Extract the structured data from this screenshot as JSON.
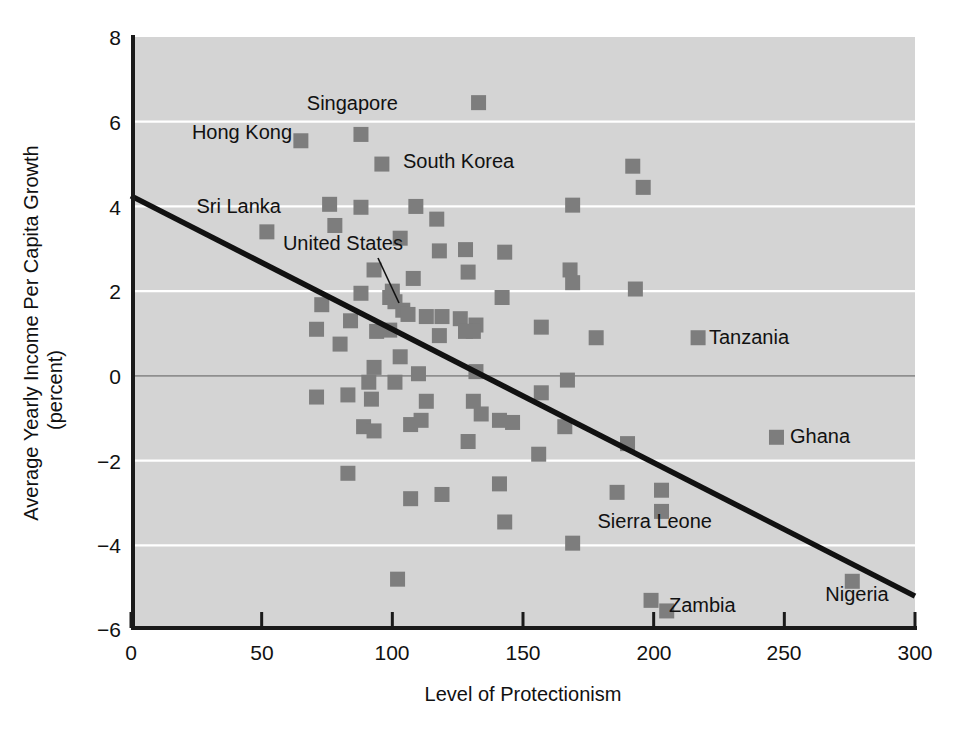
{
  "chart_data": {
    "type": "scatter",
    "title": "",
    "xlabel": "Level of Protectionism",
    "ylabel": "Average Yearly Income Per Capita Growth (percent)",
    "ylabel_line1": "Average Yearly Income Per Capita Growth",
    "ylabel_line2": "(percent)",
    "xlim": [
      0,
      300
    ],
    "ylim": [
      -6,
      8
    ],
    "xticks": [
      0,
      50,
      100,
      150,
      200,
      250,
      300
    ],
    "xtick_labels": [
      "0",
      "50",
      "100",
      "150",
      "200",
      "250",
      "300"
    ],
    "yticks": [
      8,
      6,
      4,
      2,
      0,
      -2,
      -4,
      -6
    ],
    "ytick_labels": [
      "8",
      "6",
      "4",
      "2",
      "0",
      "−2",
      "−4",
      "−6"
    ],
    "grid": true,
    "gridlines_y": [
      6,
      4,
      2,
      0,
      -2,
      -4
    ],
    "legend": "none",
    "plot_background_color": "#d4d4d4",
    "gridline_color": "#ffffff",
    "marker_color": "#7d7d7d",
    "trendline_color": "#111111",
    "marker_shape": "square",
    "trendline": {
      "label": "fitted regression line",
      "x_start": 0,
      "y_start": 4.25,
      "x_end": 300,
      "y_end": -5.2
    },
    "points": [
      {
        "x": 52,
        "y": 3.4,
        "label": "Sri Lanka"
      },
      {
        "x": 65,
        "y": 5.55,
        "label": "Hong Kong"
      },
      {
        "x": 88,
        "y": 5.7,
        "label": "Singapore"
      },
      {
        "x": 96,
        "y": 5.0,
        "label": "South Korea"
      },
      {
        "x": 99,
        "y": 1.85,
        "label": "United States"
      },
      {
        "x": 217,
        "y": 0.9,
        "label": "Tanzania"
      },
      {
        "x": 247,
        "y": -1.45,
        "label": "Ghana"
      },
      {
        "x": 203,
        "y": -2.7,
        "label": "Sierra Leone"
      },
      {
        "x": 203,
        "y": -3.2,
        "label": "Sierra Leone"
      },
      {
        "x": 205,
        "y": -5.55,
        "label": "Zambia"
      },
      {
        "x": 276,
        "y": -4.85,
        "label": "Nigeria"
      },
      {
        "x": 133,
        "y": 6.45,
        "label": ""
      },
      {
        "x": 192,
        "y": 4.95,
        "label": ""
      },
      {
        "x": 196,
        "y": 4.45,
        "label": ""
      },
      {
        "x": 76,
        "y": 4.05,
        "label": ""
      },
      {
        "x": 88,
        "y": 3.98,
        "label": ""
      },
      {
        "x": 109,
        "y": 4.0,
        "label": ""
      },
      {
        "x": 169,
        "y": 4.03,
        "label": ""
      },
      {
        "x": 78,
        "y": 3.55,
        "label": ""
      },
      {
        "x": 117,
        "y": 3.7,
        "label": ""
      },
      {
        "x": 103,
        "y": 3.25,
        "label": ""
      },
      {
        "x": 118,
        "y": 2.95,
        "label": ""
      },
      {
        "x": 128,
        "y": 2.98,
        "label": ""
      },
      {
        "x": 143,
        "y": 2.92,
        "label": ""
      },
      {
        "x": 93,
        "y": 2.5,
        "label": ""
      },
      {
        "x": 129,
        "y": 2.45,
        "label": ""
      },
      {
        "x": 168,
        "y": 2.5,
        "label": ""
      },
      {
        "x": 108,
        "y": 2.3,
        "label": ""
      },
      {
        "x": 169,
        "y": 2.2,
        "label": ""
      },
      {
        "x": 193,
        "y": 2.05,
        "label": ""
      },
      {
        "x": 88,
        "y": 1.95,
        "label": ""
      },
      {
        "x": 100,
        "y": 2.0,
        "label": ""
      },
      {
        "x": 101,
        "y": 1.75,
        "label": ""
      },
      {
        "x": 142,
        "y": 1.85,
        "label": ""
      },
      {
        "x": 73,
        "y": 1.68,
        "label": ""
      },
      {
        "x": 104,
        "y": 1.55,
        "label": ""
      },
      {
        "x": 106,
        "y": 1.45,
        "label": ""
      },
      {
        "x": 113,
        "y": 1.4,
        "label": ""
      },
      {
        "x": 119,
        "y": 1.4,
        "label": ""
      },
      {
        "x": 126,
        "y": 1.35,
        "label": ""
      },
      {
        "x": 132,
        "y": 1.2,
        "label": ""
      },
      {
        "x": 84,
        "y": 1.3,
        "label": ""
      },
      {
        "x": 71,
        "y": 1.1,
        "label": ""
      },
      {
        "x": 94,
        "y": 1.05,
        "label": ""
      },
      {
        "x": 99,
        "y": 1.08,
        "label": ""
      },
      {
        "x": 118,
        "y": 0.95,
        "label": ""
      },
      {
        "x": 128,
        "y": 1.05,
        "label": ""
      },
      {
        "x": 131,
        "y": 1.05,
        "label": ""
      },
      {
        "x": 157,
        "y": 1.15,
        "label": ""
      },
      {
        "x": 178,
        "y": 0.9,
        "label": ""
      },
      {
        "x": 80,
        "y": 0.75,
        "label": ""
      },
      {
        "x": 103,
        "y": 0.45,
        "label": ""
      },
      {
        "x": 93,
        "y": 0.2,
        "label": ""
      },
      {
        "x": 110,
        "y": 0.05,
        "label": ""
      },
      {
        "x": 132,
        "y": 0.1,
        "label": ""
      },
      {
        "x": 167,
        "y": -0.1,
        "label": ""
      },
      {
        "x": 91,
        "y": -0.15,
        "label": ""
      },
      {
        "x": 101,
        "y": -0.15,
        "label": ""
      },
      {
        "x": 71,
        "y": -0.5,
        "label": ""
      },
      {
        "x": 83,
        "y": -0.45,
        "label": ""
      },
      {
        "x": 113,
        "y": -0.6,
        "label": ""
      },
      {
        "x": 131,
        "y": -0.6,
        "label": ""
      },
      {
        "x": 157,
        "y": -0.4,
        "label": ""
      },
      {
        "x": 92,
        "y": -0.55,
        "label": ""
      },
      {
        "x": 134,
        "y": -0.9,
        "label": ""
      },
      {
        "x": 89,
        "y": -1.2,
        "label": ""
      },
      {
        "x": 93,
        "y": -1.3,
        "label": ""
      },
      {
        "x": 107,
        "y": -1.15,
        "label": ""
      },
      {
        "x": 111,
        "y": -1.05,
        "label": ""
      },
      {
        "x": 141,
        "y": -1.05,
        "label": ""
      },
      {
        "x": 146,
        "y": -1.1,
        "label": ""
      },
      {
        "x": 166,
        "y": -1.2,
        "label": ""
      },
      {
        "x": 129,
        "y": -1.55,
        "label": ""
      },
      {
        "x": 190,
        "y": -1.6,
        "label": ""
      },
      {
        "x": 156,
        "y": -1.85,
        "label": ""
      },
      {
        "x": 83,
        "y": -2.3,
        "label": ""
      },
      {
        "x": 141,
        "y": -2.55,
        "label": ""
      },
      {
        "x": 107,
        "y": -2.9,
        "label": ""
      },
      {
        "x": 119,
        "y": -2.8,
        "label": ""
      },
      {
        "x": 186,
        "y": -2.75,
        "label": ""
      },
      {
        "x": 143,
        "y": -3.45,
        "label": ""
      },
      {
        "x": 169,
        "y": -3.95,
        "label": ""
      },
      {
        "x": 102,
        "y": -4.8,
        "label": ""
      },
      {
        "x": 199,
        "y": -5.3,
        "label": ""
      }
    ],
    "annotations": [
      {
        "text": "Singapore",
        "anchor": "end",
        "point_x": 88,
        "point_y": 5.7
      },
      {
        "text": "Hong Kong",
        "anchor": "end",
        "point_x": 65,
        "point_y": 5.55
      },
      {
        "text": "South Korea",
        "anchor": "start",
        "point_x": 96,
        "point_y": 5.0
      },
      {
        "text": "Sri Lanka",
        "anchor": "end",
        "point_x": 52,
        "point_y": 3.4
      },
      {
        "text": "United States",
        "anchor": "end",
        "point_x": 99,
        "point_y": 1.85,
        "leader": true
      },
      {
        "text": "Tanzania",
        "anchor": "start",
        "point_x": 217,
        "point_y": 0.9
      },
      {
        "text": "Ghana",
        "anchor": "start",
        "point_x": 247,
        "point_y": -1.45
      },
      {
        "text": "Sierra Leone",
        "anchor": "end",
        "point_x": 203,
        "point_y": -3.2
      },
      {
        "text": "Zambia",
        "anchor": "start",
        "point_x": 205,
        "point_y": -5.55
      },
      {
        "text": "Nigeria",
        "anchor": "mid",
        "point_x": 276,
        "point_y": -4.85
      }
    ]
  },
  "labels": {
    "singapore": "Singapore",
    "hong_kong": "Hong Kong",
    "south_korea": "South Korea",
    "sri_lanka": "Sri Lanka",
    "united_states": "United States",
    "tanzania": "Tanzania",
    "ghana": "Ghana",
    "sierra_leone": "Sierra Leone",
    "zambia": "Zambia",
    "nigeria": "Nigeria"
  },
  "axes": {
    "x_title": "Level of Protectionism",
    "y_title_line1": "Average Yearly Income Per Capita Growth",
    "y_title_line2": "(percent)",
    "x_tick_0": "0",
    "x_tick_1": "50",
    "x_tick_2": "100",
    "x_tick_3": "150",
    "x_tick_4": "200",
    "x_tick_5": "250",
    "x_tick_6": "300",
    "y_tick_0": "8",
    "y_tick_1": "6",
    "y_tick_2": "4",
    "y_tick_3": "2",
    "y_tick_4": "0",
    "y_tick_5": "−2",
    "y_tick_6": "−4",
    "y_tick_7": "−6"
  }
}
